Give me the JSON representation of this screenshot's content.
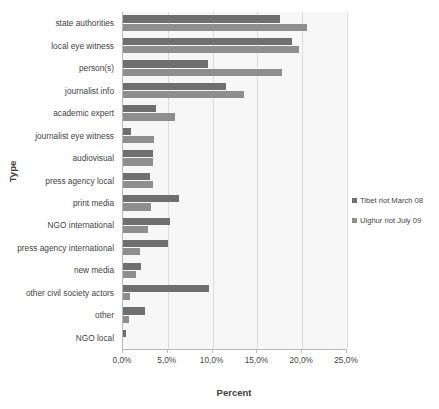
{
  "chart_data": {
    "type": "bar",
    "orientation": "horizontal",
    "title": "",
    "xlabel": "Percent",
    "ylabel": "Type",
    "xlim": [
      0,
      25
    ],
    "grid": true,
    "legend_position": "right",
    "xticks": [
      "0,0%",
      "5,0%",
      "10,0%",
      "15,0%",
      "20,0%",
      "25,0%"
    ],
    "xtick_values": [
      0,
      5,
      10,
      15,
      20,
      25
    ],
    "categories": [
      "state authorities",
      "local eye witness",
      "person(s)",
      "journalist info",
      "academic expert",
      "journalist eye witness",
      "audiovisual",
      "press agency local",
      "print media",
      "NGO international",
      "press agency international",
      "new media",
      "other civil society actors",
      "other",
      "NGO local"
    ],
    "series": [
      {
        "name": "Tibet riot March 08",
        "color": "#6f6f6f",
        "values": [
          17.5,
          18.9,
          9.5,
          11.5,
          3.7,
          0.9,
          3.4,
          3.0,
          6.2,
          5.2,
          5.0,
          2.0,
          9.6,
          2.4,
          0.3
        ]
      },
      {
        "name": "Uighur riot July 09",
        "color": "#8e8e8e",
        "values": [
          20.5,
          19.6,
          17.8,
          13.5,
          5.8,
          3.5,
          3.4,
          3.4,
          3.1,
          2.8,
          1.9,
          1.5,
          0.8,
          0.7,
          0.0
        ]
      }
    ]
  }
}
